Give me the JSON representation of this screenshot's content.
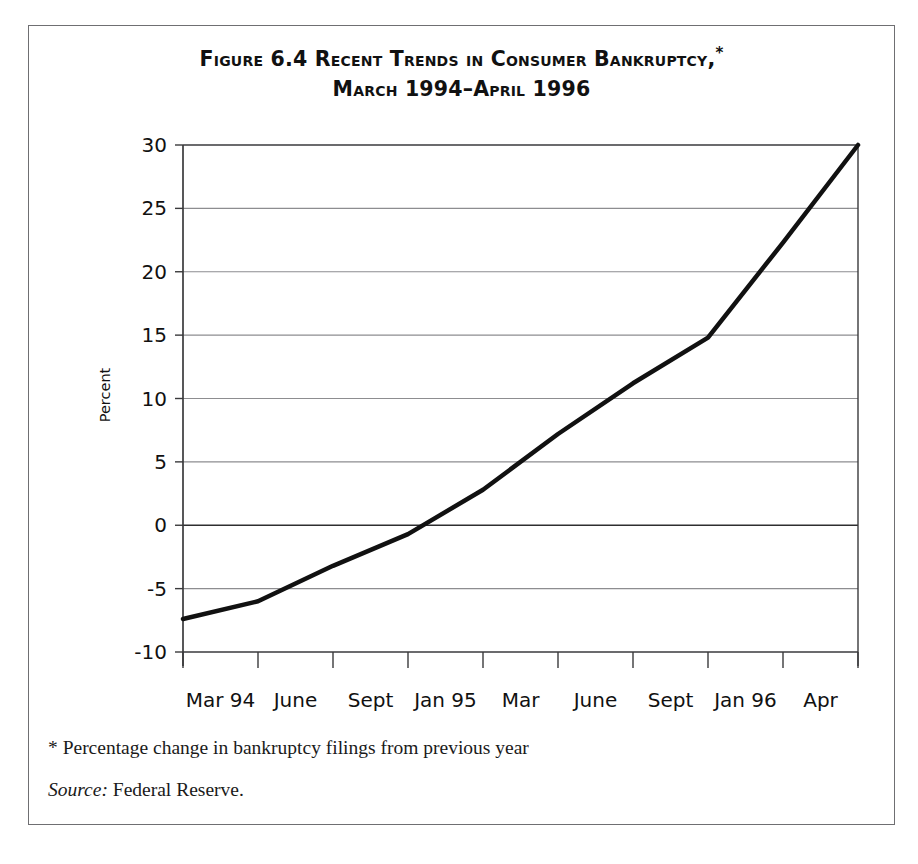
{
  "figure": {
    "title_line1": "Figure 6.4 Recent Trends in Consumer Bankruptcy,",
    "title_star": "*",
    "title_line2": "March 1994–April 1996",
    "footnote": "* Percentage change in bankruptcy filings from previous year",
    "source_label": "Source:",
    "source_value": " Federal Reserve."
  },
  "chart_data": {
    "type": "line",
    "subtitle": "",
    "xlabel": "",
    "ylabel": "Percent",
    "ylim": [
      -10,
      30
    ],
    "ytick_values": [
      30,
      25,
      20,
      15,
      10,
      5,
      0,
      -5,
      -10
    ],
    "ytick_labels": [
      "30",
      "25",
      "20",
      "15",
      "10",
      "5",
      "0",
      "-5",
      "-10"
    ],
    "x_tick_labels": [
      "Mar 94",
      "June",
      "Sept",
      "Jan 95",
      "Mar",
      "June",
      "Sept",
      "Jan 96",
      "Apr"
    ],
    "x": [
      "Mar 94",
      "June 94",
      "Sept 94",
      "Jan 95",
      "Mar 95",
      "June 95",
      "Sept 95",
      "Jan 96",
      "Apr 96"
    ],
    "values": [
      -7.4,
      -6.0,
      -3.2,
      -0.7,
      2.8,
      7.2,
      11.2,
      14.8,
      22.3
    ],
    "series": [
      {
        "name": "Percentage change in bankruptcy filings from previous year",
        "points": [
          {
            "x_index": 0,
            "label": "Mar 94",
            "value": -7.4
          },
          {
            "x_index": 1,
            "label": "June 94",
            "value": -6.0
          },
          {
            "x_index": 2,
            "label": "Sept 94",
            "value": -3.2
          },
          {
            "x_index": 3,
            "label": "Jan 95",
            "value": -0.7
          },
          {
            "x_index": 4,
            "label": "Mar 95",
            "value": 2.8
          },
          {
            "x_index": 5,
            "label": "June 95",
            "value": 7.2
          },
          {
            "x_index": 6,
            "label": "Sept 95",
            "value": 11.2
          },
          {
            "x_index": 7,
            "label": "Jan 96",
            "value": 14.8
          },
          {
            "x_index": 8,
            "label": "Apr 96",
            "value": 22.3
          },
          {
            "x_index": 9,
            "label": "",
            "value": 30.0
          }
        ],
        "color": "#111111",
        "line_width": 4.5
      }
    ],
    "grid": true,
    "grid_color": "#8d8d90",
    "zero_line_emphasis": true,
    "legend": "none",
    "x_tick_count": 10
  },
  "colors": {
    "frame": "#6f6f72",
    "axis": "#3a3a3c",
    "grid": "#8d8d90",
    "line": "#111111",
    "text": "#111111",
    "background": "#ffffff"
  }
}
